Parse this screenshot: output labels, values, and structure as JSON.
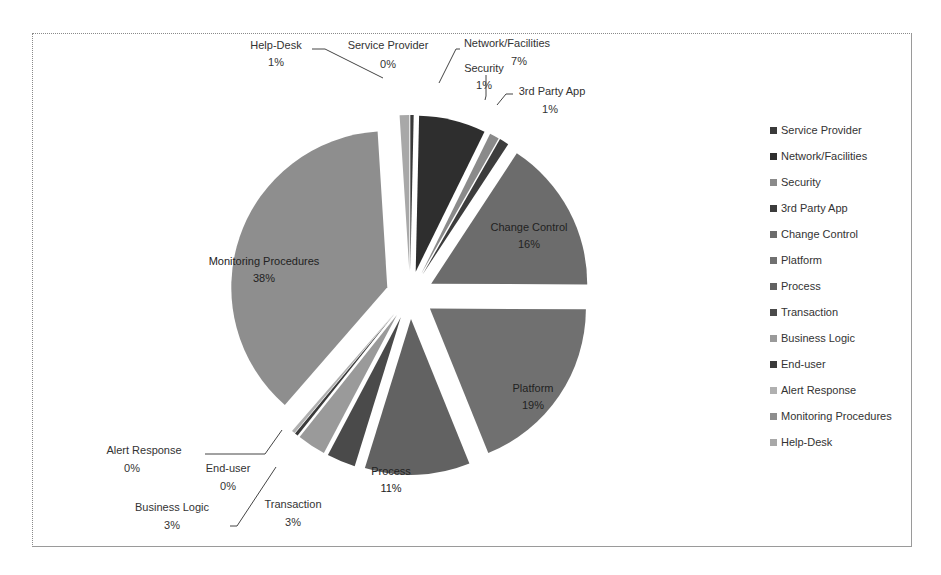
{
  "chart_data": {
    "type": "pie",
    "title": "",
    "exploded": true,
    "legend_position": "right",
    "categories": [
      "Service Provider",
      "Network/Facilities",
      "Security",
      "3rd Party App",
      "Change Control",
      "Platform",
      "Process",
      "Transaction",
      "Business Logic",
      "End-user",
      "Alert Response",
      "Monitoring Procedures",
      "Help-Desk"
    ],
    "values": [
      0,
      7,
      1,
      1,
      16,
      19,
      11,
      3,
      3,
      0,
      0,
      38,
      1
    ],
    "labels": [
      "0%",
      "7%",
      "1%",
      "1%",
      "16%",
      "19%",
      "11%",
      "3%",
      "3%",
      "0%",
      "0%",
      "38%",
      "1%"
    ],
    "colors": [
      "#3a3a3a",
      "#2e2e2e",
      "#8a8a8a",
      "#3c3c3c",
      "#6c6c6c",
      "#707070",
      "#626262",
      "#4a4a4a",
      "#9a9a9a",
      "#3a3a3a",
      "#b0b0b0",
      "#8e8e8e",
      "#a8a8a8"
    ]
  },
  "legend": {
    "items": [
      {
        "label": "Service Provider",
        "color": "#3a3a3a"
      },
      {
        "label": "Network/Facilities",
        "color": "#2e2e2e"
      },
      {
        "label": "Security",
        "color": "#8a8a8a"
      },
      {
        "label": "3rd Party App",
        "color": "#3c3c3c"
      },
      {
        "label": "Change Control",
        "color": "#6c6c6c"
      },
      {
        "label": "Platform",
        "color": "#707070"
      },
      {
        "label": "Process",
        "color": "#626262"
      },
      {
        "label": "Transaction",
        "color": "#4a4a4a"
      },
      {
        "label": "Business Logic",
        "color": "#9a9a9a"
      },
      {
        "label": "End-user",
        "color": "#3a3a3a"
      },
      {
        "label": "Alert Response",
        "color": "#b0b0b0"
      },
      {
        "label": "Monitoring Procedures",
        "color": "#8e8e8e"
      },
      {
        "label": "Help-Desk",
        "color": "#a8a8a8"
      }
    ]
  },
  "slice_labels": {
    "help_desk": {
      "name": "Help-Desk",
      "pct": "1%"
    },
    "service_provider": {
      "name": "Service Provider",
      "pct": "0%"
    },
    "network": {
      "name": "Network/Facilities",
      "pct": "7%"
    },
    "security": {
      "name": "Security",
      "pct": "1%"
    },
    "third_party": {
      "name": "3rd Party App",
      "pct": "1%"
    },
    "change_control": {
      "name": "Change Control",
      "pct": "16%"
    },
    "platform": {
      "name": "Platform",
      "pct": "19%"
    },
    "process": {
      "name": "Process",
      "pct": "11%"
    },
    "transaction": {
      "name": "Transaction",
      "pct": "3%"
    },
    "business_logic": {
      "name": "Business Logic",
      "pct": "3%"
    },
    "end_user": {
      "name": "End-user",
      "pct": "0%"
    },
    "alert_response": {
      "name": "Alert Response",
      "pct": "0%"
    },
    "monitoring": {
      "name": "Monitoring Procedures",
      "pct": "38%"
    }
  }
}
